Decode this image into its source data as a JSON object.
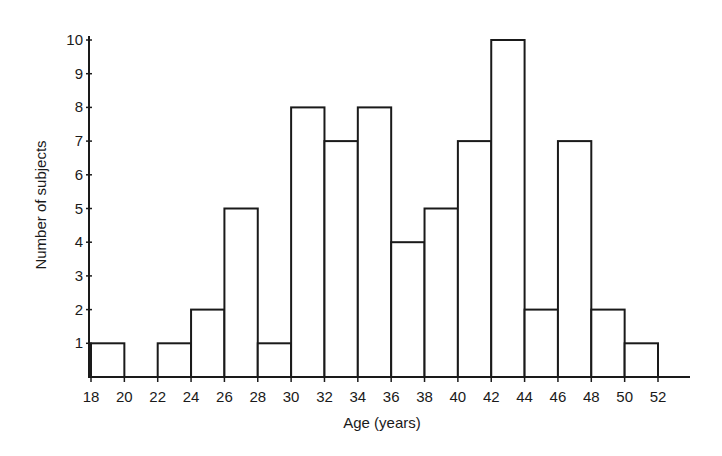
{
  "chart_data": {
    "type": "bar",
    "subtype": "histogram",
    "title": "",
    "xlabel": "Age (years)",
    "ylabel": "Number of subjects",
    "bin_edges": [
      18,
      20,
      22,
      24,
      26,
      28,
      30,
      32,
      34,
      36,
      38,
      40,
      42,
      44,
      46,
      48,
      50,
      52
    ],
    "categories": [
      "18-20",
      "20-22",
      "22-24",
      "24-26",
      "26-28",
      "28-30",
      "30-32",
      "32-34",
      "34-36",
      "36-38",
      "38-40",
      "40-42",
      "42-44",
      "44-46",
      "46-48",
      "48-50",
      "50-52"
    ],
    "values": [
      1,
      0,
      1,
      2,
      5,
      1,
      8,
      7,
      8,
      4,
      5,
      7,
      10,
      2,
      7,
      2,
      1
    ],
    "x_tick_labels": [
      "18",
      "20",
      "22",
      "24",
      "26",
      "28",
      "30",
      "32",
      "34",
      "36",
      "38",
      "40",
      "42",
      "44",
      "46",
      "48",
      "50",
      "52"
    ],
    "y_tick_labels": [
      "1",
      "2",
      "3",
      "4",
      "5",
      "6",
      "7",
      "8",
      "9",
      "10"
    ],
    "ylim": [
      0,
      10
    ],
    "xlim": [
      18,
      52
    ],
    "grid": false,
    "legend": null
  }
}
